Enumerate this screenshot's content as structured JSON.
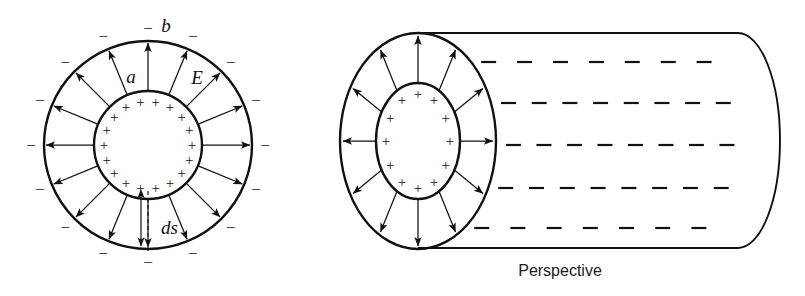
{
  "figure": {
    "caption": "Perspective",
    "stroke_color": "#111111",
    "background_color": "#ffffff"
  },
  "cross_section": {
    "name": "cross-section-view",
    "center": {
      "x": 148,
      "y": 145
    },
    "inner_radius": 54,
    "outer_radius": 104,
    "labels": {
      "inner_radius_label": "a",
      "outer_radius_label": "b",
      "field_label": "E",
      "surface_element_label": "ds"
    },
    "label_positions": {
      "a": {
        "x": 131,
        "y": 83
      },
      "b": {
        "x": 166,
        "y": 32
      },
      "E": {
        "x": 197,
        "y": 84
      },
      "ds": {
        "x": 161,
        "y": 228
      }
    },
    "inner_charge_symbol": "+",
    "outer_charge_symbol": "−",
    "inner_charge_count": 18,
    "outer_charge_count": 16,
    "field_arrow_count": 16,
    "inner_charge_angles_deg": [
      70,
      90,
      110,
      130,
      150,
      170,
      190,
      210,
      230,
      250,
      270,
      290,
      310,
      330,
      350,
      10,
      30,
      50
    ],
    "outer_charge_angles_deg": [
      90,
      112.5,
      135,
      157.5,
      180,
      202.5,
      225,
      247.5,
      270,
      292.5,
      315,
      337.5,
      0,
      22.5,
      45,
      67.5
    ],
    "field_arrow_angles_deg": [
      90,
      112.5,
      135,
      157.5,
      180,
      202.5,
      225,
      247.5,
      270,
      292.5,
      315,
      337.5,
      0,
      22.5,
      45,
      67.5
    ],
    "ds_element": {
      "angle_deg": 270,
      "dashed_line": true,
      "double_headed_arrow": true
    }
  },
  "perspective": {
    "name": "perspective-view",
    "front_face": {
      "center": {
        "x": 418,
        "y": 141
      },
      "outer_rx": 78,
      "outer_ry": 108,
      "inner_rx": 42,
      "inner_ry": 58
    },
    "cylinder": {
      "top_y": 33,
      "bottom_y": 248,
      "right_x": 780,
      "cap_rx": 42
    },
    "inner_charge_symbol": "+",
    "inner_charge_count": 12,
    "inner_charge_angles_deg": [
      60,
      90,
      120,
      150,
      180,
      210,
      240,
      270,
      300,
      330,
      0,
      30
    ],
    "field_arrow_count": 12,
    "field_arrow_angles_deg": [
      60,
      90,
      120,
      150,
      180,
      210,
      240,
      270,
      300,
      330,
      0,
      30
    ],
    "surface_charge_symbol": "−",
    "surface_charge_rows": 5,
    "surface_charge_row_y": [
      62,
      103,
      145,
      188,
      228
    ],
    "surface_charge_columns_per_row": [
      7,
      8,
      8,
      8,
      7
    ],
    "surface_charge_dash_length": 15,
    "caption_position": {
      "x": 560,
      "y": 276
    }
  }
}
